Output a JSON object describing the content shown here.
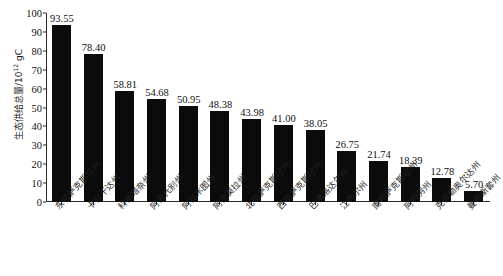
{
  "chart_data": {
    "type": "bar",
    "title": "",
    "xlabel": "",
    "ylabel": "生态供给总量/10¹² gC",
    "ylabel_base": "生态供给总量/10",
    "ylabel_exp": "12",
    "ylabel_unit": " gC",
    "ylim": [
      0,
      100
    ],
    "yticks": [
      100,
      90,
      80,
      70,
      60,
      50,
      40,
      30,
      20,
      10,
      0
    ],
    "grid": false,
    "legend": null,
    "bar_color": "#0b0b0b",
    "categories": [
      "东哈萨克斯坦州",
      "卡拉干达州",
      "科斯塔奈州",
      "阿克托别州",
      "阿拉木图州",
      "阿克莫拉州",
      "北哈萨克斯坦州",
      "西哈萨克斯坦州",
      "巴甫洛达尔州",
      "江布尔州",
      "南哈萨克斯坦州",
      "阿特劳州",
      "克孜勒奥尔达州",
      "曼格斯套州"
    ],
    "values": [
      93.55,
      78.4,
      58.81,
      54.68,
      50.95,
      48.38,
      43.98,
      41.0,
      38.05,
      26.75,
      21.74,
      18.39,
      12.78,
      5.7
    ],
    "value_labels": [
      "93.55",
      "78.40",
      "58.81",
      "54.68",
      "50.95",
      "48.38",
      "43.98",
      "41.00",
      "38.05",
      "26.75",
      "21.74",
      "18.39",
      "12.78",
      "5.70"
    ]
  }
}
